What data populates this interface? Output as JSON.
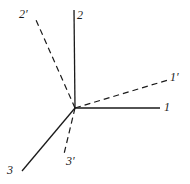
{
  "figure": {
    "type": "vector-axes-diagram",
    "width": 190,
    "height": 184,
    "background_color": "#ffffff",
    "line_color": "#1a1a1a",
    "origin": {
      "x": 75,
      "y": 108
    }
  },
  "axes": [
    {
      "id": "axis-2",
      "label": "2",
      "style": "solid",
      "stroke_width": 1.3,
      "from": {
        "x": 75,
        "y": 108
      },
      "to": {
        "x": 74,
        "y": 10
      },
      "label_position": {
        "x": 77,
        "y": 9
      }
    },
    {
      "id": "axis-1",
      "label": "1",
      "style": "solid",
      "stroke_width": 1.3,
      "from": {
        "x": 75,
        "y": 108
      },
      "to": {
        "x": 160,
        "y": 108
      },
      "label_position": {
        "x": 164,
        "y": 101
      }
    },
    {
      "id": "axis-3",
      "label": "3",
      "style": "solid",
      "stroke_width": 1.3,
      "from": {
        "x": 75,
        "y": 108
      },
      "to": {
        "x": 22,
        "y": 171
      },
      "label_position": {
        "x": 7,
        "y": 164
      }
    },
    {
      "id": "axis-2-prime",
      "label": "2'",
      "style": "dashed",
      "stroke_width": 1.2,
      "dash_pattern": "6 4",
      "from": {
        "x": 75,
        "y": 108
      },
      "to": {
        "x": 36,
        "y": 20
      },
      "label_position": {
        "x": 19,
        "y": 8
      }
    },
    {
      "id": "axis-1-prime",
      "label": "1'",
      "style": "dashed",
      "stroke_width": 1.2,
      "dash_pattern": "6 4",
      "from": {
        "x": 75,
        "y": 108
      },
      "to": {
        "x": 168,
        "y": 80
      },
      "label_position": {
        "x": 170,
        "y": 71
      }
    },
    {
      "id": "axis-3-prime",
      "label": "3'",
      "style": "dashed",
      "stroke_width": 1.2,
      "dash_pattern": "6 4",
      "from": {
        "x": 75,
        "y": 108
      },
      "to": {
        "x": 64,
        "y": 154
      },
      "label_position": {
        "x": 66,
        "y": 155
      }
    }
  ],
  "labels": {
    "axis_2": "2",
    "axis_1": "1",
    "axis_3": "3",
    "axis_2_prime": "2′",
    "axis_1_prime": "1′",
    "axis_3_prime": "3′"
  }
}
